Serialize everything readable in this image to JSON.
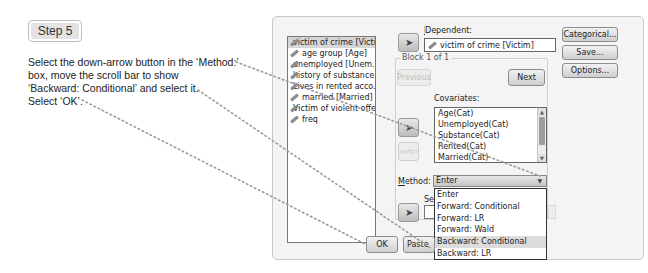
{
  "step": {
    "label": "Step 5"
  },
  "instructions": {
    "lines": [
      "Select the down-arrow button in the ‘Method:’",
      "box, move the scroll bar to show",
      "‘Backward: Conditional’ and select it.",
      "Select ‘OK’."
    ]
  },
  "dialog": {
    "variables": [
      {
        "label": "victim of crime [Victim]",
        "selected": true
      },
      {
        "label": "age group [Age]"
      },
      {
        "label": "unemployed [Unem..."
      },
      {
        "label": "history of substance..."
      },
      {
        "label": "Lives in rented acco..."
      },
      {
        "label": "married [Married]"
      },
      {
        "label": "Victim of violent offe..."
      },
      {
        "label": "freq"
      }
    ],
    "dependent": {
      "label": "Dependent:",
      "value": "victim of crime [Victim]"
    },
    "block": {
      "label": "Block 1 of 1",
      "previous": "Previous",
      "next": "Next"
    },
    "covariates": {
      "label": "Covariates:",
      "items": [
        "Age(Cat)",
        "Unemployed(Cat)",
        "Substance(Cat)",
        "Rented(Cat)",
        "Married(Cat)"
      ]
    },
    "interaction_button": ">a*b>",
    "method": {
      "label": "Method:",
      "value": "Enter",
      "options": [
        "Enter",
        "Forward: Conditional",
        "Forward: LR",
        "Forward: Wald",
        "Backward: Conditional",
        "Backward: LR"
      ],
      "highlighted": "Backward: Conditional"
    },
    "selection_label": "Se",
    "side_buttons": {
      "categorical": "Categorical...",
      "save": "Save...",
      "options": "Options..."
    },
    "bottom_buttons": {
      "ok": "OK",
      "paste": "Paste"
    }
  },
  "colors": {
    "dotted_line": "#9a9a9a",
    "dialog_bg": "#f4f4f4"
  }
}
